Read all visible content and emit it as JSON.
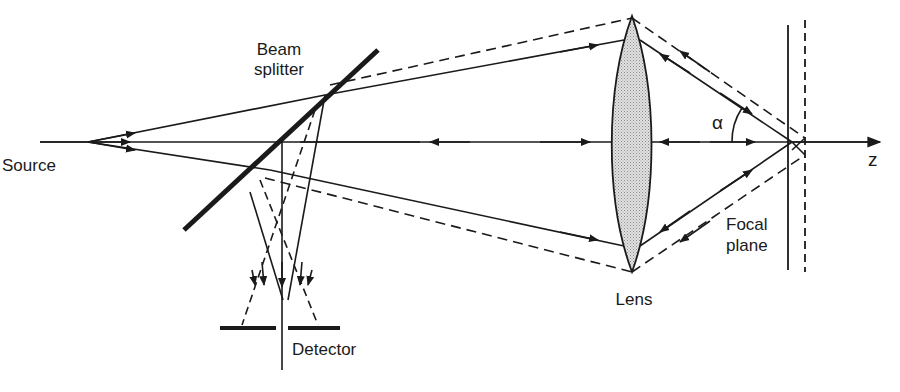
{
  "diagram": {
    "type": "optical-setup",
    "colors": {
      "ink": "#1a1a1a",
      "lens_fill": "#c8c8c8",
      "background": "#ffffff"
    },
    "labels": {
      "source": "Source",
      "beam_splitter_line1": "Beam",
      "beam_splitter_line2": "splitter",
      "detector": "Detector",
      "lens": "Lens",
      "focal_plane_line1": "Focal",
      "focal_plane_line2": "plane",
      "angle": "α",
      "axis": "z"
    },
    "components": [
      "Source",
      "Beam splitter",
      "Lens",
      "Focal plane",
      "Detector"
    ],
    "ray_styles": {
      "in_focus": "solid",
      "defocused": "dashed"
    }
  }
}
